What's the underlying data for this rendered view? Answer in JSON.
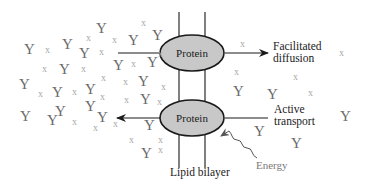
{
  "diagram": {
    "membrane": {
      "label": "Lipid bilayer"
    },
    "proteins": [
      {
        "label": "Protein",
        "process": "Facilitated diffusion",
        "direction": "left-to-right"
      },
      {
        "label": "Protein",
        "process": "Active transport",
        "direction": "right-to-left"
      }
    ],
    "labels": {
      "facilitated_line1": "Facilitated",
      "facilitated_line2": "diffusion",
      "active_line1": "Active",
      "active_line2": "transport",
      "energy": "Energy",
      "lipid_bilayer": "Lipid bilayer",
      "protein_top": "Protein",
      "protein_bottom": "Protein"
    },
    "molecule_glyphs": {
      "solute_y": "Y",
      "solute_x": "x"
    },
    "colors": {
      "protein_fill": "#c8c8c8",
      "protein_stroke": "#1a1a1a",
      "solute_y": "#6a6a6a",
      "solute_x": "#a8a8a8",
      "energy": "#7a7a7a"
    }
  }
}
